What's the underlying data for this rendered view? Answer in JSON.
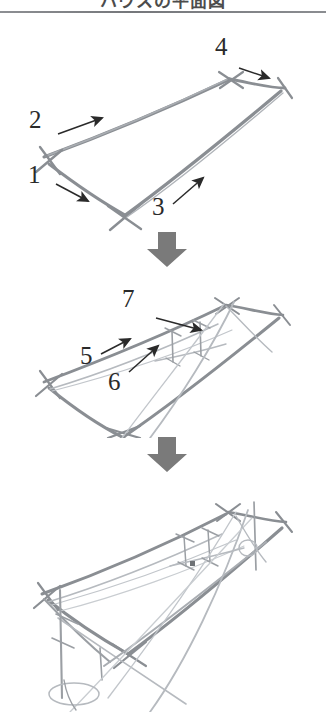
{
  "document": {
    "title_partial": "ハウスの平面図",
    "title_note": "clipped-heading",
    "background_color": "#ffffff",
    "rule_color": "#7d7f83"
  },
  "palette": {
    "pencil_dark": "#6e7276",
    "pencil_mid": "#8d9196",
    "pencil_light": "#b3b7bc",
    "pencil_faint": "#c9cdd1",
    "ink_black": "#2a2a2a",
    "divider_arrow": "#7a7a7a"
  },
  "panels": [
    {
      "id": "panel-step-1",
      "name": "base-parallelogram",
      "caption": "",
      "steps": [
        {
          "number": "1",
          "label_x": 32,
          "label_y": 152,
          "arrow_from": [
            56,
            168
          ],
          "arrow_to": [
            91,
            186
          ]
        },
        {
          "number": "2",
          "label_x": 33,
          "label_y": 102,
          "arrow_from": [
            57,
            118
          ],
          "arrow_to": [
            105,
            102
          ]
        },
        {
          "number": "3",
          "label_x": 159,
          "label_y": 188,
          "arrow_from": [
            172,
            188
          ],
          "arrow_to": [
            205,
            160
          ]
        },
        {
          "number": "4",
          "label_x": 219,
          "label_y": 31,
          "arrow_from": [
            239,
            52
          ],
          "arrow_to": [
            272,
            62
          ]
        }
      ]
    },
    {
      "id": "panel-step-2",
      "name": "vertical-members-added",
      "caption": "",
      "steps": [
        {
          "number": "5",
          "label_x": 84,
          "label_y": 343,
          "arrow_from": [
            101,
            352
          ],
          "arrow_to": [
            132,
            337
          ]
        },
        {
          "number": "6",
          "label_x": 112,
          "label_y": 369,
          "arrow_from": [
            129,
            372
          ],
          "arrow_to": [
            160,
            345
          ]
        },
        {
          "number": "7",
          "label_x": 126,
          "label_y": 286,
          "arrow_from": [
            156,
            317
          ],
          "arrow_to": [
            204,
            328
          ]
        }
      ]
    },
    {
      "id": "panel-step-3",
      "name": "completed-construction",
      "caption": "",
      "steps": []
    }
  ],
  "dividers": [
    {
      "id": "divider-arrow-1",
      "name": "down-arrow",
      "glyph": "down-arrow",
      "x": 146,
      "y": 232
    },
    {
      "id": "divider-arrow-2",
      "name": "down-arrow",
      "glyph": "down-arrow",
      "x": 146,
      "y": 437
    }
  ]
}
